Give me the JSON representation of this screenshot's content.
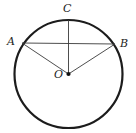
{
  "figure": {
    "type": "geometry-diagram",
    "width": 136,
    "height": 133,
    "background_color": "#ffffff"
  },
  "labels": {
    "a": "A",
    "b": "B",
    "c": "C",
    "o": "O"
  },
  "colors": {
    "circle_stroke": "#1c1c1c",
    "segment_stroke": "#3a3a3a",
    "label_color": "#1c1c1c",
    "center_dot": "#111111"
  },
  "geometry": {
    "circle": {
      "center_x": 68.5,
      "center_y": 74,
      "radius": 54,
      "stroke_width": 2.2
    },
    "points": {
      "A": {
        "x": 22.0,
        "y": 43.0
      },
      "B": {
        "x": 115.0,
        "y": 44.0
      },
      "C": {
        "x": 68.5,
        "y": 20.0
      },
      "O": {
        "x": 68.5,
        "y": 74.0
      }
    },
    "segments": [
      {
        "name": "chord-AB",
        "x1": 22.0,
        "y1": 43.0,
        "x2": 115.0,
        "y2": 44.0,
        "stroke_width": 0.9
      },
      {
        "name": "radius-OA",
        "x1": 68.5,
        "y1": 74.0,
        "x2": 22.0,
        "y2": 43.0,
        "stroke_width": 0.9
      },
      {
        "name": "radius-OB",
        "x1": 68.5,
        "y1": 74.0,
        "x2": 115.0,
        "y2": 44.0,
        "stroke_width": 0.9
      },
      {
        "name": "radius-OC",
        "x1": 68.5,
        "y1": 74.0,
        "x2": 68.5,
        "y2": 20.0,
        "stroke_width": 0.9
      }
    ],
    "center_dot_radius": 2.1
  }
}
